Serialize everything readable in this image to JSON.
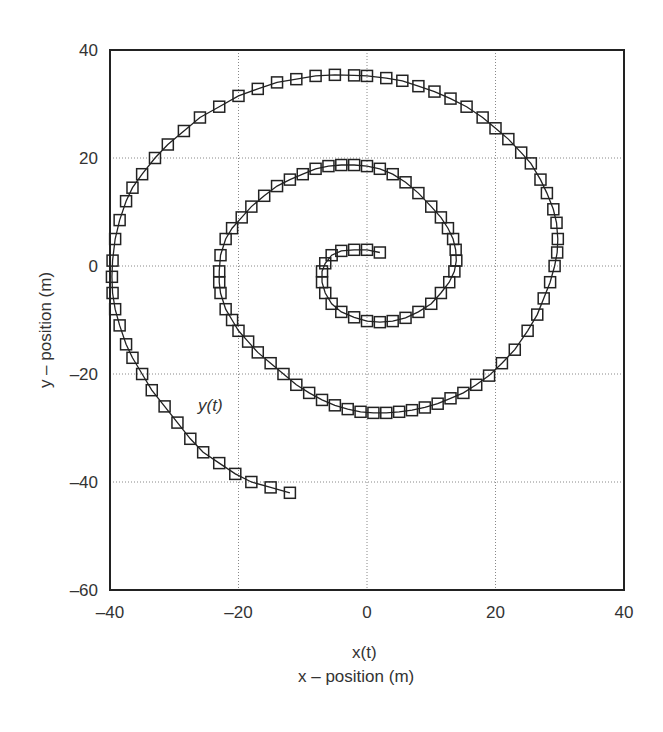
{
  "chart_data": {
    "type": "line",
    "title": "",
    "xlabel_top": "x(t)",
    "xlabel": "x – position (m)",
    "ylabel": "y – position (m)",
    "annotation": "y(t)",
    "xlim": [
      -40,
      40
    ],
    "ylim": [
      -60,
      40
    ],
    "xticks": [
      -40,
      -20,
      0,
      20,
      40
    ],
    "yticks": [
      40,
      20,
      0,
      -20,
      -40,
      -60
    ],
    "grid": true,
    "marker": "square",
    "series": [
      {
        "name": "trajectory",
        "points": [
          [
            2,
            2.5
          ],
          [
            0,
            3
          ],
          [
            -2,
            3
          ],
          [
            -4,
            2.8
          ],
          [
            -5.5,
            2
          ],
          [
            -6.5,
            0.5
          ],
          [
            -7,
            -1
          ],
          [
            -7,
            -3
          ],
          [
            -6.5,
            -5
          ],
          [
            -5.5,
            -7
          ],
          [
            -4,
            -8.5
          ],
          [
            -2,
            -9.5
          ],
          [
            0,
            -10.2
          ],
          [
            2,
            -10.4
          ],
          [
            4,
            -10.2
          ],
          [
            6,
            -9.6
          ],
          [
            8,
            -8.5
          ],
          [
            10,
            -7
          ],
          [
            11.5,
            -5
          ],
          [
            12.8,
            -3
          ],
          [
            13.6,
            -1
          ],
          [
            13.9,
            1
          ],
          [
            13.8,
            3
          ],
          [
            13.4,
            5
          ],
          [
            12.6,
            7
          ],
          [
            11.5,
            9
          ],
          [
            10,
            11
          ],
          [
            8,
            13.5
          ],
          [
            6,
            15.5
          ],
          [
            4,
            17
          ],
          [
            2,
            18
          ],
          [
            0,
            18.5
          ],
          [
            -2,
            18.7
          ],
          [
            -4,
            18.7
          ],
          [
            -6,
            18.5
          ],
          [
            -8,
            18
          ],
          [
            -10,
            17
          ],
          [
            -12,
            16
          ],
          [
            -14,
            14.8
          ],
          [
            -16,
            13
          ],
          [
            -18,
            11
          ],
          [
            -19.5,
            9
          ],
          [
            -21,
            7
          ],
          [
            -22,
            5
          ],
          [
            -22.8,
            2
          ],
          [
            -23,
            -1
          ],
          [
            -23,
            -3
          ],
          [
            -22.8,
            -5
          ],
          [
            -22,
            -8
          ],
          [
            -21,
            -10
          ],
          [
            -20,
            -12
          ],
          [
            -18.5,
            -14
          ],
          [
            -17,
            -16
          ],
          [
            -15,
            -18
          ],
          [
            -13,
            -20
          ],
          [
            -11,
            -22
          ],
          [
            -9,
            -23.5
          ],
          [
            -7,
            -24.8
          ],
          [
            -5,
            -25.8
          ],
          [
            -3,
            -26.5
          ],
          [
            -1,
            -27
          ],
          [
            1,
            -27.2
          ],
          [
            3,
            -27.2
          ],
          [
            5,
            -27
          ],
          [
            7,
            -26.7
          ],
          [
            9,
            -26.2
          ],
          [
            11,
            -25.5
          ],
          [
            13,
            -24.5
          ],
          [
            15,
            -23.5
          ],
          [
            17,
            -22
          ],
          [
            19,
            -20.3
          ],
          [
            21,
            -18
          ],
          [
            23,
            -15.5
          ],
          [
            25,
            -12
          ],
          [
            26.5,
            -9
          ],
          [
            27.5,
            -6
          ],
          [
            28.5,
            -3
          ],
          [
            29.2,
            0
          ],
          [
            29.6,
            2.5
          ],
          [
            29.7,
            5
          ],
          [
            29.5,
            8
          ],
          [
            29,
            10.5
          ],
          [
            28,
            13.5
          ],
          [
            27,
            16
          ],
          [
            25.5,
            19
          ],
          [
            24,
            21
          ],
          [
            22,
            23.5
          ],
          [
            20,
            25.5
          ],
          [
            18,
            27.5
          ],
          [
            15.5,
            29.5
          ],
          [
            13,
            31
          ],
          [
            10.5,
            32.3
          ],
          [
            8,
            33.3
          ],
          [
            5.5,
            34.3
          ],
          [
            3,
            34.8
          ],
          [
            0,
            35.2
          ],
          [
            -2,
            35.3
          ],
          [
            -5,
            35.4
          ],
          [
            -8,
            35.2
          ],
          [
            -11,
            34.6
          ],
          [
            -14,
            34
          ],
          [
            -17,
            32.8
          ],
          [
            -20,
            31.5
          ],
          [
            -23,
            29.5
          ],
          [
            -26,
            27.5
          ],
          [
            -28.5,
            25
          ],
          [
            -31,
            22.5
          ],
          [
            -33,
            20
          ],
          [
            -35,
            17
          ],
          [
            -36.5,
            14.5
          ],
          [
            -37.5,
            12
          ],
          [
            -38.5,
            8.5
          ],
          [
            -39.2,
            5
          ],
          [
            -39.6,
            1
          ],
          [
            -39.7,
            -2
          ],
          [
            -39.6,
            -5
          ],
          [
            -39.2,
            -8
          ],
          [
            -38.5,
            -11
          ],
          [
            -37.5,
            -14.5
          ],
          [
            -36.5,
            -17
          ],
          [
            -35,
            -20
          ],
          [
            -33.5,
            -23
          ],
          [
            -31.5,
            -26
          ],
          [
            -29.5,
            -29
          ],
          [
            -27.5,
            -32
          ],
          [
            -25.5,
            -34.5
          ],
          [
            -23,
            -36.5
          ],
          [
            -20.5,
            -38.5
          ],
          [
            -18,
            -40
          ],
          [
            -15,
            -41
          ],
          [
            -12,
            -42
          ]
        ]
      }
    ]
  }
}
